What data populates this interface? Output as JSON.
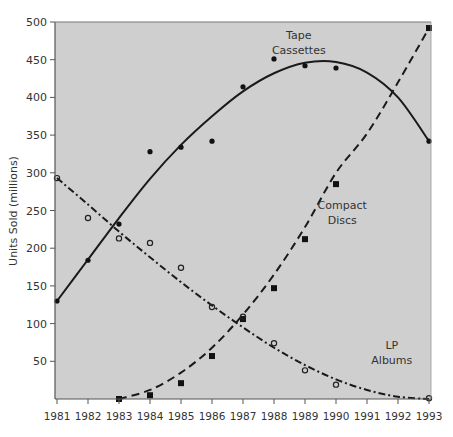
{
  "chart_data": {
    "type": "scatter",
    "title": "",
    "xlabel": "",
    "ylabel": "Units Sold (millions)",
    "xlim": [
      1981,
      1993
    ],
    "ylim": [
      0,
      500
    ],
    "grid": false,
    "x_ticks": [
      1981,
      1982,
      1983,
      1984,
      1985,
      1986,
      1987,
      1988,
      1989,
      1990,
      1991,
      1992,
      1993
    ],
    "y_ticks": [
      50,
      100,
      150,
      200,
      250,
      300,
      350,
      400,
      450,
      500
    ],
    "background": "#cfcfcf",
    "series": [
      {
        "name": "Tape Cassettes",
        "label_lines": [
          "Tape",
          "Cassettes"
        ],
        "marker": "filled-circle",
        "line_style": "solid",
        "x": [
          1981,
          1982,
          1983,
          1984,
          1985,
          1986,
          1987,
          1988,
          1989,
          1990,
          1993
        ],
        "values": [
          130,
          184,
          232,
          328,
          334,
          342,
          414,
          451,
          442,
          439,
          342
        ],
        "fit_curve": [
          [
            1981,
            130
          ],
          [
            1982,
            185
          ],
          [
            1983,
            240
          ],
          [
            1984,
            292
          ],
          [
            1985,
            337
          ],
          [
            1986,
            375
          ],
          [
            1987,
            408
          ],
          [
            1988,
            432
          ],
          [
            1989,
            446
          ],
          [
            1990,
            447
          ],
          [
            1991,
            433
          ],
          [
            1992,
            400
          ],
          [
            1993,
            342
          ]
        ],
        "label_pos": [
          1988.8,
          478
        ]
      },
      {
        "name": "Compact Discs",
        "label_lines": [
          "Compact",
          "Discs"
        ],
        "marker": "filled-square",
        "line_style": "dashed",
        "x": [
          1983,
          1984,
          1985,
          1986,
          1987,
          1988,
          1989,
          1990,
          1993
        ],
        "values": [
          0,
          5,
          21,
          57,
          106,
          147,
          212,
          285,
          492
        ],
        "fit_curve": [
          [
            1983,
            0
          ],
          [
            1984,
            12
          ],
          [
            1985,
            35
          ],
          [
            1986,
            68
          ],
          [
            1987,
            112
          ],
          [
            1988,
            165
          ],
          [
            1989,
            228
          ],
          [
            1990,
            300
          ],
          [
            1991,
            352
          ],
          [
            1992,
            420
          ],
          [
            1993,
            492
          ]
        ],
        "label_pos": [
          1990.2,
          252
        ]
      },
      {
        "name": "LP Albums",
        "label_lines": [
          "LP",
          "Albums"
        ],
        "marker": "open-circle",
        "line_style": "dash-dot",
        "x": [
          1981,
          1982,
          1983,
          1984,
          1985,
          1986,
          1987,
          1988,
          1989,
          1990,
          1993
        ],
        "values": [
          293,
          240,
          213,
          207,
          174,
          122,
          109,
          74,
          38,
          19,
          1
        ],
        "fit_curve": [
          [
            1981,
            293
          ],
          [
            1982,
            258
          ],
          [
            1983,
            222
          ],
          [
            1984,
            188
          ],
          [
            1985,
            155
          ],
          [
            1986,
            124
          ],
          [
            1987,
            95
          ],
          [
            1988,
            68
          ],
          [
            1989,
            45
          ],
          [
            1990,
            26
          ],
          [
            1991,
            12
          ],
          [
            1992,
            3
          ],
          [
            1993,
            0
          ]
        ],
        "label_pos": [
          1991.8,
          66
        ]
      }
    ]
  }
}
